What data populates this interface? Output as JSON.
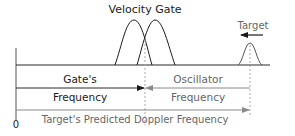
{
  "diagram": {
    "title": "Velocity Gate",
    "target_label": "Target",
    "gate_label_line1": "Gate's",
    "gate_label_line2": "Frequency",
    "osc_label_line1": "Oscillator",
    "osc_label_line2": "Frequency",
    "doppler_label": "Target's  Predicted Doppler Frequency",
    "origin_label": "0",
    "colors": {
      "dark_line": "#2a2a2a",
      "gray_line": "#8a8a8a",
      "dashed": "#a8a8a8",
      "gray_text": "#666666"
    }
  }
}
